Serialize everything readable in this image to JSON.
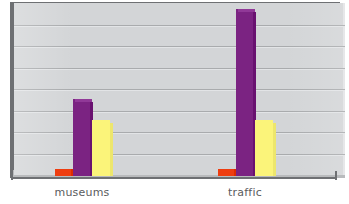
{
  "chart_data": {
    "type": "bar",
    "title": "",
    "subtitle": "",
    "xlabel": "",
    "ylabel": "",
    "categories": [
      "museums",
      "traffic"
    ],
    "series": [
      {
        "name": "series-1",
        "color": "#ee3d10",
        "values": [
          4,
          4
        ]
      },
      {
        "name": "series-2",
        "color": "#7b2382",
        "values": [
          45,
          98
        ]
      },
      {
        "name": "series-3",
        "color": "#fbf47a",
        "values": [
          33,
          33
        ]
      }
    ],
    "ylim": [
      0,
      100
    ],
    "yticks": [
      0,
      12.5,
      25,
      37.5,
      50,
      62.5,
      75,
      87.5,
      100
    ],
    "grid": true,
    "gridlines": 7,
    "legend": "none",
    "style": "3d-column",
    "annotations": []
  },
  "chart": {
    "plot_background_color": "#d3d5d7",
    "gridline_color": "#a9abad",
    "axis_color": "#6e7073",
    "floor_color": "#b9bbbd",
    "label_color": "#5a5c5e",
    "canvas_background": "#ffffff"
  },
  "axis": {
    "bottom_tick_right": "",
    "bottom_tick_left": ""
  }
}
